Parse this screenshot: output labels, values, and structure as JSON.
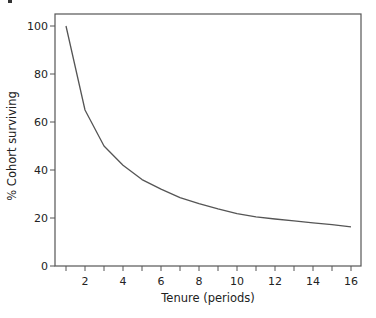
{
  "chart_data": {
    "type": "line",
    "title": "",
    "xlabel": "Tenure (periods)",
    "ylabel": "% Cohort surviving",
    "xlim": [
      0.5,
      16.5
    ],
    "ylim": [
      0,
      105
    ],
    "x_ticks": [
      1,
      2,
      3,
      4,
      5,
      6,
      7,
      8,
      9,
      10,
      11,
      12,
      13,
      14,
      15,
      16
    ],
    "x_tick_labels": [
      "",
      "2",
      "",
      "4",
      "",
      "6",
      "",
      "8",
      "",
      "10",
      "",
      "12",
      "",
      "14",
      "",
      "16"
    ],
    "y_ticks": [
      0,
      20,
      40,
      60,
      80,
      100
    ],
    "y_tick_labels": [
      "0",
      "20",
      "40",
      "60",
      "80",
      "100"
    ],
    "grid": false,
    "legend": null,
    "series": [
      {
        "name": "% Cohort surviving",
        "color": "#555555",
        "x": [
          1,
          2,
          3,
          4,
          5,
          6,
          7,
          8,
          9,
          10,
          11,
          12,
          13,
          14,
          15,
          16
        ],
        "values": [
          100,
          65,
          50,
          42,
          36,
          32,
          28.5,
          26,
          23.8,
          21.8,
          20.5,
          19.6,
          18.8,
          18,
          17.2,
          16.3
        ]
      }
    ]
  }
}
